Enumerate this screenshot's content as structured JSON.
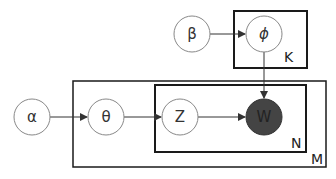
{
  "diagram": {
    "type": "plate-notation",
    "nodes": [
      {
        "id": "alpha",
        "label": "α",
        "cx": 32,
        "cy": 117,
        "observed": false
      },
      {
        "id": "theta",
        "label": "θ",
        "cx": 106,
        "cy": 117,
        "observed": false
      },
      {
        "id": "z",
        "label": "Z",
        "cx": 180,
        "cy": 117,
        "observed": false
      },
      {
        "id": "w",
        "label": "W",
        "cx": 264,
        "cy": 117,
        "observed": true
      },
      {
        "id": "beta",
        "label": "β",
        "cx": 192,
        "cy": 34,
        "observed": false
      },
      {
        "id": "phi",
        "label": "ϕ",
        "cx": 264,
        "cy": 34,
        "observed": false
      }
    ],
    "edges": [
      {
        "from": "alpha",
        "to": "theta"
      },
      {
        "from": "theta",
        "to": "z"
      },
      {
        "from": "z",
        "to": "w"
      },
      {
        "from": "beta",
        "to": "phi"
      },
      {
        "from": "phi",
        "to": "w"
      }
    ],
    "plates": [
      {
        "id": "K",
        "label": "K",
        "contains": [
          "phi"
        ]
      },
      {
        "id": "M",
        "label": "M",
        "contains": [
          "theta",
          "z",
          "w"
        ]
      },
      {
        "id": "N",
        "label": "N",
        "contains": [
          "z",
          "w"
        ]
      }
    ],
    "colors": {
      "observed_fill": "#444444",
      "node_stroke": "#888888",
      "plate_stroke": "#1a1a1a",
      "edge": "#333333"
    }
  }
}
